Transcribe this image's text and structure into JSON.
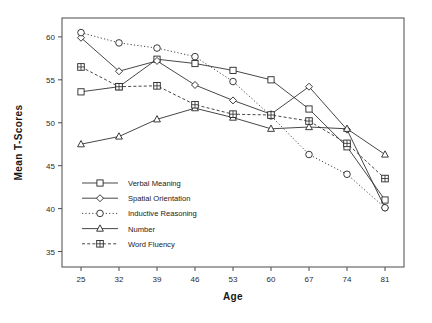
{
  "chart_data": {
    "type": "line",
    "title": "",
    "xlabel": "Age",
    "ylabel": "Mean T-Scores",
    "x": [
      25,
      32,
      39,
      46,
      53,
      60,
      67,
      74,
      81
    ],
    "xtick_labels": [
      "25",
      "32",
      "39",
      "46",
      "53",
      "60",
      "67",
      "74",
      "81"
    ],
    "ytick_labels": [
      "35",
      "40",
      "45",
      "50",
      "55",
      "60"
    ],
    "yticks": [
      35,
      40,
      45,
      50,
      55,
      60
    ],
    "xlim": [
      21.5,
      84.5
    ],
    "ylim": [
      33.2,
      62.2
    ],
    "grid": false,
    "legend_position": "inside-lower-left",
    "series": [
      {
        "name": "Verbal Meaning",
        "marker": "square",
        "line": "solid",
        "values": [
          53.6,
          54.2,
          57.4,
          56.9,
          56.1,
          55.0,
          51.6,
          47.2,
          41.0
        ]
      },
      {
        "name": "Spatial Orientation",
        "marker": "diamond",
        "line": "solid",
        "values": [
          59.9,
          56.0,
          57.2,
          54.4,
          52.6,
          51.0,
          54.2,
          49.2,
          40.1
        ]
      },
      {
        "name": "Inductive Reasoning",
        "marker": "circle-open",
        "line": "dotted",
        "values": [
          60.5,
          59.3,
          58.7,
          57.7,
          54.8,
          50.8,
          46.3,
          44.0,
          40.1
        ]
      },
      {
        "name": "Number",
        "marker": "triangle",
        "line": "solid",
        "values": [
          47.5,
          48.4,
          50.4,
          51.7,
          50.6,
          49.3,
          49.5,
          49.3,
          46.3
        ]
      },
      {
        "name": "Word Fluency",
        "marker": "crossed-square",
        "line": "dashed",
        "values": [
          56.5,
          54.2,
          54.3,
          52.1,
          51.0,
          50.9,
          50.2,
          47.6,
          43.5
        ]
      }
    ]
  }
}
